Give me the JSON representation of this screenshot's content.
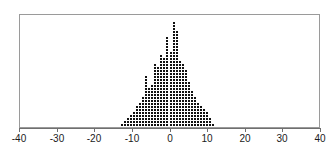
{
  "chart_data": {
    "type": "scatter",
    "plot_style": "stacked-dot-plot",
    "title": "",
    "subtitle": "",
    "xlabel": "",
    "ylabel": "",
    "xlim": [
      -40,
      40
    ],
    "ylim": [
      0,
      38
    ],
    "grid": false,
    "legend": null,
    "legend_position": "none",
    "xticks": [
      -40,
      -30,
      -20,
      -10,
      0,
      10,
      20,
      30,
      40
    ],
    "xtick_labels": [
      "-40",
      "-30",
      "-20",
      "-10",
      "0",
      "10",
      "20",
      "30",
      "40"
    ],
    "yticks": [],
    "ytick_labels": [],
    "dot_value_unit": 1,
    "bin_width": 0.8,
    "annotations": [],
    "marker_color": "#111111",
    "frame_color": "#9a9a9a",
    "axis_color": "#6f6f6f",
    "background_color": "#ffffff",
    "x": [
      -16.0,
      -14.4,
      -13.6,
      -12.8,
      -12.0,
      -11.2,
      -10.4,
      -9.6,
      -8.8,
      -8.0,
      -7.2,
      -6.4,
      -5.6,
      -4.8,
      -4.0,
      -3.2,
      -2.4,
      -1.6,
      -0.8,
      0.0,
      0.8,
      1.6,
      2.4,
      3.2,
      4.0,
      4.8,
      5.6,
      6.4,
      7.2,
      8.0,
      8.8,
      9.6,
      10.4,
      11.2,
      12.0,
      12.8,
      13.6,
      14.4,
      15.2
    ],
    "counts": [
      1,
      1,
      1,
      2,
      3,
      4,
      5,
      6,
      8,
      9,
      11,
      18,
      14,
      15,
      22,
      21,
      25,
      24,
      31,
      26,
      36,
      33,
      23,
      22,
      20,
      16,
      13,
      11,
      9,
      8,
      7,
      6,
      4,
      2,
      1,
      1,
      1,
      1,
      1
    ],
    "total_observations": 491,
    "center_estimate": 0.8,
    "data_min": -16.0,
    "data_max": 15.2
  },
  "axis": {
    "x_tick_labels": [
      "-40",
      "-30",
      "-20",
      "-10",
      "0",
      "10",
      "20",
      "30",
      "40"
    ]
  }
}
